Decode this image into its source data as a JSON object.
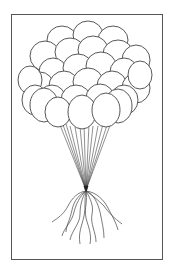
{
  "image": {
    "title": "Balloon bunch coloring page",
    "description": "Line-art drawing of a bunch of balloons with strings tied together at a single point, with loose curly ribbon ends hanging below, inside a rectangular border.",
    "colors": {
      "background": "#ffffff",
      "line": "#444444",
      "border": "#555555"
    },
    "balloon_count": 29
  }
}
